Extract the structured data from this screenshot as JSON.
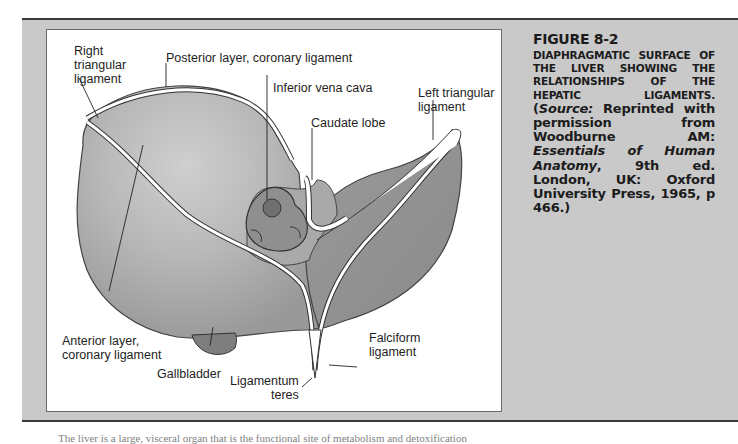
{
  "figure": {
    "number": "FIGURE 8-2",
    "heading": "DIAPHRAGMATIC SURFACE OF THE LIVER SHOWING THE RELATIONSHIPS OF THE HEPATIC LIGAMENTS.",
    "source_open": "(",
    "source_label": "Source:",
    "source_text_1": " Reprinted with permission from Woodburne AM: ",
    "source_book": "Essentials of Human Anatomy",
    "source_text_2": ", 9th ed. London, UK: Oxford University Press, 1965, p 466.)"
  },
  "labels": {
    "right_triangular": [
      "Right",
      "triangular",
      "ligament"
    ],
    "posterior_layer": "Posterior layer, coronary ligament",
    "inferior_vena_cava": "Inferior vena cava",
    "left_triangular": [
      "Left triangular",
      "ligament"
    ],
    "caudate_lobe": "Caudate lobe",
    "anterior_layer": [
      "Anterior layer,",
      "coronary ligament"
    ],
    "gallbladder": "Gallbladder",
    "falciform": [
      "Falciform",
      "ligament"
    ],
    "ligamentum_teres": [
      "Ligamentum",
      "teres"
    ]
  },
  "body_text": "The liver is a large, visceral organ that is the functional site of metabolism and detoxification",
  "colors": {
    "band": "#c9c9c9",
    "liver_light": "#b9b9b9",
    "liver_mid": "#a5a5a5",
    "liver_dark": "#8e8e8e",
    "rule": "#3a3a3a"
  }
}
